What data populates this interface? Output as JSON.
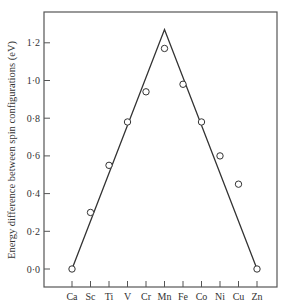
{
  "chart_data": {
    "type": "scatter",
    "title": "",
    "xlabel": "",
    "ylabel": "Energy difference between spin configurations (eV)",
    "categories": [
      "Ca",
      "Sc",
      "Ti",
      "V",
      "Cr",
      "Mn",
      "Fe",
      "Co",
      "Ni",
      "Cu",
      "Zn"
    ],
    "series": [
      {
        "name": "Data points (open circles)",
        "marker": "open-circle",
        "values": [
          0.0,
          0.3,
          0.55,
          0.78,
          0.94,
          1.17,
          0.98,
          0.78,
          0.6,
          0.45,
          0.0
        ]
      },
      {
        "name": "Linear trend (triangle)",
        "type": "line",
        "points": [
          {
            "x": "Ca",
            "y": 0.0
          },
          {
            "x": "Mn",
            "y": 1.27
          },
          {
            "x": "Zn",
            "y": 0.0
          }
        ]
      }
    ],
    "y_ticks": [
      "0·0",
      "0·2",
      "0·4",
      "0·6",
      "0·8",
      "1·0",
      "1·2"
    ],
    "y_tick_values": [
      0.0,
      0.2,
      0.4,
      0.6,
      0.8,
      1.0,
      1.2
    ],
    "ylim": [
      -0.1,
      1.36
    ],
    "grid": false,
    "legend": "none"
  }
}
